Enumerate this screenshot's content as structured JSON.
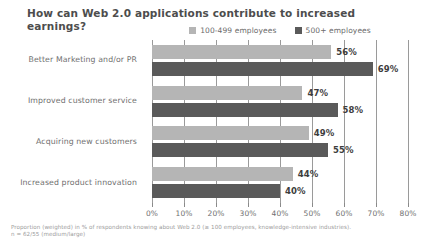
{
  "title": "How can Web 2.0 applications contribute to increased earnings?",
  "legend": {
    "position": "top-center",
    "items": [
      {
        "label": "100-499 employees",
        "color": "#b5b5b5",
        "icon": "square-swatch"
      },
      {
        "label": "500+ employees",
        "color": "#5a5a5a",
        "icon": "square-swatch"
      }
    ]
  },
  "footnote": {
    "line1": "Proportion (weighted) in % of respondents knowing about Web 2.0 (≥ 100 employees, knowledge-intensive industries).",
    "line2": "n = 62/55 (medium/large)"
  },
  "colors": {
    "series_light": "#b5b5b5",
    "series_dark": "#5a5a5a",
    "gridline": "#9a9a9a",
    "title_text": "#4d4d4d",
    "label_text": "#6f6f6f",
    "value_text": "#3d3d3d",
    "footnote_text": "#9b9b9b",
    "background": "#ffffff"
  },
  "chart_data": {
    "type": "bar",
    "orientation": "horizontal",
    "title": "How can Web 2.0 applications contribute to increased earnings?",
    "xlabel": "",
    "ylabel": "",
    "xlim": [
      0,
      80
    ],
    "grid": true,
    "legend_position": "top-center",
    "categories": [
      "Better Marketing and/or PR",
      "Improved customer service",
      "Acquiring new customers",
      "Increased product innovation"
    ],
    "tick_labels": [
      "0%",
      "10%",
      "20%",
      "30%",
      "40%",
      "50%",
      "60%",
      "70%",
      "80%"
    ],
    "tick_values": [
      0,
      10,
      20,
      30,
      40,
      50,
      60,
      70,
      80
    ],
    "series": [
      {
        "name": "100-499 employees",
        "color": "#b5b5b5",
        "values": [
          56,
          47,
          49,
          44
        ],
        "value_labels": [
          "56%",
          "47%",
          "49%",
          "44%"
        ]
      },
      {
        "name": "500+ employees",
        "color": "#5a5a5a",
        "values": [
          69,
          58,
          55,
          40
        ],
        "value_labels": [
          "69%",
          "58%",
          "55%",
          "40%"
        ]
      }
    ]
  }
}
